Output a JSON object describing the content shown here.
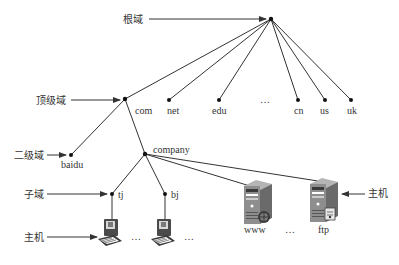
{
  "diagram": {
    "title": "",
    "colors": {
      "line": "#333333",
      "node": "#111111",
      "text": "#333333",
      "server_body": "#8a8a8a",
      "server_dark": "#5a5a5a",
      "pc_body": "#4a4a4a"
    },
    "level_labels": {
      "root": "根域",
      "top_level": "顶级域",
      "second_level": "二级域",
      "subdomain": "子域",
      "host_left": "主机",
      "host_right": "主机"
    },
    "nodes": {
      "root": "",
      "com": "com",
      "net": "net",
      "edu": "edu",
      "tld_ellipsis": "…",
      "cn": "cn",
      "us": "us",
      "uk": "uk",
      "baidu": "baidu",
      "company": "company",
      "tj": "tj",
      "bj": "bj",
      "www": "www",
      "server_ellipsis": "…",
      "ftp": "ftp",
      "pc_ellipsis_1": "…",
      "pc_ellipsis_2": "…"
    },
    "icons": {
      "tj_host": "desktop-computer-icon",
      "bj_host": "desktop-computer-icon",
      "www_host": "web-server-icon",
      "ftp_host": "ftp-server-icon"
    },
    "edges": [
      [
        "root",
        "com"
      ],
      [
        "root",
        "net"
      ],
      [
        "root",
        "edu"
      ],
      [
        "root",
        "cn"
      ],
      [
        "root",
        "us"
      ],
      [
        "root",
        "uk"
      ],
      [
        "com",
        "baidu"
      ],
      [
        "com",
        "company"
      ],
      [
        "company",
        "tj"
      ],
      [
        "company",
        "bj"
      ],
      [
        "company",
        "www"
      ],
      [
        "company",
        "ftp"
      ],
      [
        "tj",
        "tj_host"
      ],
      [
        "bj",
        "bj_host"
      ]
    ]
  }
}
